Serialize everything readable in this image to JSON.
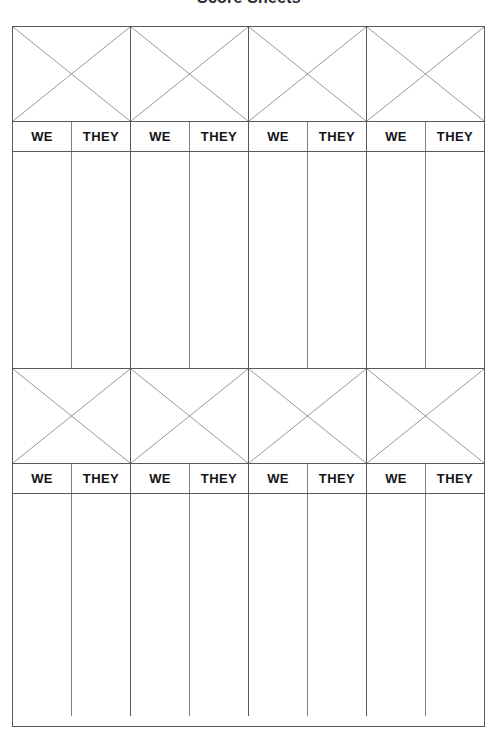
{
  "document": {
    "title": "Score Sheets",
    "page_width": 498,
    "page_height": 737
  },
  "colors": {
    "grid_line": "#555a5e",
    "grid_line_light": "#7c8185",
    "diagonal_line": "#8a8f94",
    "text": "#141417",
    "title_text": "#2a2a2e",
    "background": "#ffffff"
  },
  "sheet": {
    "column_labels": [
      "WE",
      "THEY",
      "WE",
      "THEY",
      "WE",
      "THEY",
      "WE",
      "THEY"
    ],
    "pairs_per_block": 4,
    "blocks": [
      {
        "name": "score-block-1",
        "header_style": "diagonal-cross",
        "header_cells": [
          "x-cell-1",
          "x-cell-2",
          "x-cell-3",
          "x-cell-4"
        ],
        "labels": [
          "WE",
          "THEY",
          "WE",
          "THEY",
          "WE",
          "THEY",
          "WE",
          "THEY"
        ],
        "entries": [
          "",
          "",
          "",
          "",
          "",
          "",
          "",
          ""
        ]
      },
      {
        "name": "score-block-2",
        "header_style": "diagonal-cross",
        "header_cells": [
          "x-cell-1",
          "x-cell-2",
          "x-cell-3",
          "x-cell-4"
        ],
        "labels": [
          "WE",
          "THEY",
          "WE",
          "THEY",
          "WE",
          "THEY",
          "WE",
          "THEY"
        ],
        "entries": [
          "",
          "",
          "",
          "",
          "",
          "",
          "",
          ""
        ]
      }
    ]
  }
}
